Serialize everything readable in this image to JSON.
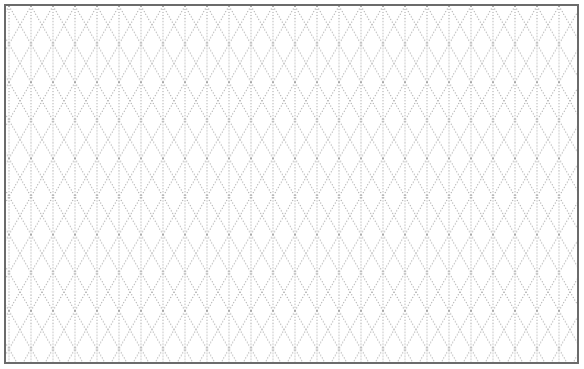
{
  "page": {
    "title": "Isometric dotted grid paper"
  },
  "grid": {
    "type": "isometric",
    "line_style": "dotted",
    "vertical_spacing_px": 22,
    "diagonal_angle_deg": 60,
    "line_color": "#9a9a9a",
    "border_color": "#6b6b6b",
    "background_color": "#ffffff"
  }
}
